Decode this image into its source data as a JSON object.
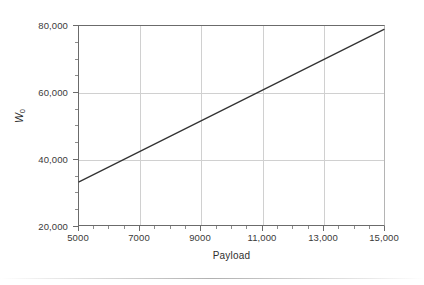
{
  "chart_data": {
    "type": "line",
    "title": "",
    "subtitle": "",
    "xlabel": "Payload",
    "ylabel": "W0",
    "ylabel_base": "W",
    "ylabel_sub": "0",
    "x": [
      5000,
      15000
    ],
    "values": [
      33000,
      79000
    ],
    "series": [
      {
        "name": "W0",
        "x": [
          5000,
          6000,
          7000,
          8000,
          9000,
          10000,
          11000,
          12000,
          13000,
          14000,
          15000
        ],
        "values": [
          33000,
          37600,
          42200,
          46800,
          51400,
          56000,
          60600,
          65200,
          69800,
          74400,
          79000
        ],
        "color": "#333333"
      }
    ],
    "xlim": [
      5000,
      15000
    ],
    "ylim": [
      20000,
      80000
    ],
    "xticks": [
      5000,
      7000,
      9000,
      11000,
      13000,
      15000
    ],
    "xticklabels": [
      "5000",
      "7000",
      "9000",
      "11,000",
      "13,000",
      "15,000"
    ],
    "yticks": [
      20000,
      40000,
      60000,
      80000
    ],
    "yticklabels": [
      "20,000",
      "40,000",
      "60,000",
      "80,000"
    ],
    "x_minor_step": 500,
    "y_minor_step": 5000,
    "grid": true,
    "grid_color": "#d0d0d0",
    "legend": null,
    "legend_position": "none",
    "axis_color": "#6b6b6b",
    "background": "#ffffff"
  }
}
